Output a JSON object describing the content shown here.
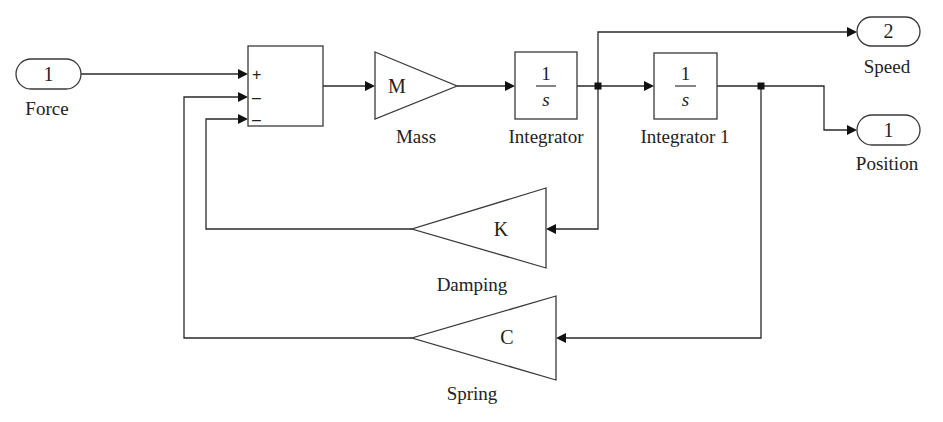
{
  "diagram": {
    "type": "simulink-block-diagram",
    "blocks": {
      "force_inport": {
        "number": "1",
        "label": "Force"
      },
      "sum": {
        "signs": [
          "+",
          "–",
          "–"
        ]
      },
      "mass_gain": {
        "symbol": "M",
        "label": "Mass"
      },
      "integrator": {
        "numerator": "1",
        "denominator": "s",
        "label": "Integrator"
      },
      "integrator1": {
        "numerator": "1",
        "denominator": "s",
        "label": "Integrator 1"
      },
      "speed_outport": {
        "number": "2",
        "label": "Speed"
      },
      "position_outport": {
        "number": "1",
        "label": "Position"
      },
      "damping_gain": {
        "symbol": "K",
        "label": "Damping"
      },
      "spring_gain": {
        "symbol": "C",
        "label": "Spring"
      }
    },
    "connections": [
      {
        "from": "Force",
        "to": "Sum (+)"
      },
      {
        "from": "Sum",
        "to": "Mass"
      },
      {
        "from": "Mass",
        "to": "Integrator"
      },
      {
        "from": "Integrator",
        "to": "Integrator 1"
      },
      {
        "from": "Integrator",
        "to": "Speed"
      },
      {
        "from": "Integrator",
        "to": "Damping"
      },
      {
        "from": "Integrator 1",
        "to": "Position"
      },
      {
        "from": "Integrator 1",
        "to": "Spring"
      },
      {
        "from": "Damping",
        "to": "Sum (–) 3"
      },
      {
        "from": "Spring",
        "to": "Sum (–) 2"
      }
    ]
  }
}
